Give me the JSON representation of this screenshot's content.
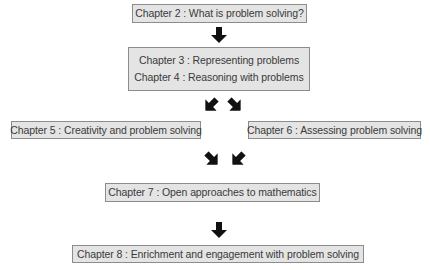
{
  "diagram": {
    "nodes": [
      {
        "id": "ch2",
        "label": "Chapter 2 : What is problem solving?"
      },
      {
        "id": "ch3",
        "label": "Chapter 3 : Representing problems"
      },
      {
        "id": "ch4",
        "label": "Chapter 4 : Reasoning with problems"
      },
      {
        "id": "ch5",
        "label": "Chapter 5 : Creativity and problem solving"
      },
      {
        "id": "ch6",
        "label": "Chapter 6 : Assessing problem solving"
      },
      {
        "id": "ch7",
        "label": "Chapter 7 : Open approaches to mathematics"
      },
      {
        "id": "ch8",
        "label": "Chapter 8 : Enrichment and engagement with problem solving"
      }
    ],
    "edges": [
      {
        "from": "ch2",
        "to": "ch3-ch4",
        "direction": "down"
      },
      {
        "from": "ch3-ch4",
        "to": "ch5",
        "direction": "down-left"
      },
      {
        "from": "ch3-ch4",
        "to": "ch6",
        "direction": "down-right"
      },
      {
        "from": "ch5",
        "to": "ch7",
        "direction": "down-right"
      },
      {
        "from": "ch6",
        "to": "ch7",
        "direction": "down-left"
      },
      {
        "from": "ch7",
        "to": "ch8",
        "direction": "down"
      }
    ],
    "colors": {
      "box_fill": "#e4e4e4",
      "box_border": "#8c8c8c",
      "text": "#3a3a3a",
      "arrow": "#111111"
    }
  }
}
